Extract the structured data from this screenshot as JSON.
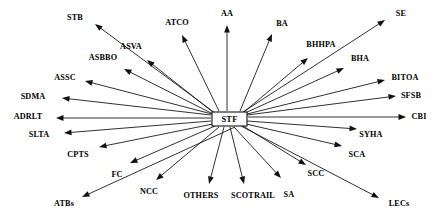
{
  "diagram": {
    "type": "radial-network",
    "canvas": {
      "width": 439,
      "height": 217
    },
    "style": {
      "background_color": "#ffffff",
      "line_color": "#1a1a1a",
      "arrow_color": "#111111",
      "text_color": "#000000",
      "node_fill": "#ffffff",
      "node_stroke": "#111111"
    },
    "center": {
      "label": "STF",
      "x": 229.5,
      "y": 119,
      "box": {
        "x": 212,
        "y": 112,
        "width": 35,
        "height": 14
      }
    },
    "edge_count": 24,
    "nodes": [
      {
        "id": "stb",
        "label": "STB",
        "label_x": 75,
        "label_y": 18,
        "tip_x": 95,
        "tip_y": 24,
        "start_x": 215,
        "start_y": 113
      },
      {
        "id": "atco",
        "label": "ATCO",
        "label_x": 177,
        "label_y": 23,
        "tip_x": 182,
        "tip_y": 35,
        "start_x": 219,
        "start_y": 111
      },
      {
        "id": "aa",
        "label": "AA",
        "label_x": 227,
        "label_y": 14,
        "tip_x": 227,
        "tip_y": 25,
        "start_x": 227,
        "start_y": 111
      },
      {
        "id": "ba",
        "label": "BA",
        "label_x": 282,
        "label_y": 24,
        "tip_x": 272,
        "tip_y": 34,
        "start_x": 240,
        "start_y": 111
      },
      {
        "id": "se",
        "label": "SE",
        "label_x": 401,
        "label_y": 14,
        "tip_x": 385,
        "tip_y": 20,
        "start_x": 243,
        "start_y": 112
      },
      {
        "id": "asva",
        "label": "ASVA",
        "label_x": 131,
        "label_y": 47,
        "tip_x": 147,
        "tip_y": 60,
        "start_x": 214,
        "start_y": 113
      },
      {
        "id": "asbbo",
        "label": "ASBBO",
        "label_x": 103,
        "label_y": 58,
        "tip_x": 124,
        "tip_y": 69,
        "start_x": 213,
        "start_y": 114
      },
      {
        "id": "bhhpa",
        "label": "BHHPA",
        "label_x": 321,
        "label_y": 45,
        "tip_x": 308,
        "tip_y": 58,
        "start_x": 244,
        "start_y": 112
      },
      {
        "id": "bha",
        "label": "BHA",
        "label_x": 360,
        "label_y": 59,
        "tip_x": 344,
        "tip_y": 68,
        "start_x": 245,
        "start_y": 113
      },
      {
        "id": "assc",
        "label": "ASSC",
        "label_x": 65,
        "label_y": 78,
        "tip_x": 85,
        "tip_y": 81,
        "start_x": 212,
        "start_y": 114
      },
      {
        "id": "bitoa",
        "label": "BITOA",
        "label_x": 405,
        "label_y": 78,
        "tip_x": 385,
        "tip_y": 80,
        "start_x": 247,
        "start_y": 114
      },
      {
        "id": "sdma",
        "label": "SDMA",
        "label_x": 33,
        "label_y": 97,
        "tip_x": 62,
        "tip_y": 98,
        "start_x": 211,
        "start_y": 115
      },
      {
        "id": "sfsb",
        "label": "SFSB",
        "label_x": 411,
        "label_y": 96,
        "tip_x": 396,
        "tip_y": 96,
        "start_x": 247,
        "start_y": 115
      },
      {
        "id": "adrlt",
        "label": "ADRLT",
        "label_x": 28,
        "label_y": 117,
        "tip_x": 56,
        "tip_y": 118,
        "start_x": 211,
        "start_y": 118
      },
      {
        "id": "cbi",
        "label": "CBI",
        "label_x": 419,
        "label_y": 117,
        "tip_x": 406,
        "tip_y": 117,
        "start_x": 248,
        "start_y": 117
      },
      {
        "id": "slta",
        "label": "SLTA",
        "label_x": 39,
        "label_y": 135,
        "tip_x": 64,
        "tip_y": 133,
        "start_x": 211,
        "start_y": 121
      },
      {
        "id": "syha",
        "label": "SYHA",
        "label_x": 371,
        "label_y": 135,
        "tip_x": 357,
        "tip_y": 129,
        "start_x": 247,
        "start_y": 121
      },
      {
        "id": "cpts",
        "label": "CPTS",
        "label_x": 78,
        "label_y": 155,
        "tip_x": 99,
        "tip_y": 147,
        "start_x": 213,
        "start_y": 124
      },
      {
        "id": "sca",
        "label": "SCA",
        "label_x": 357,
        "label_y": 155,
        "tip_x": 342,
        "tip_y": 146,
        "start_x": 246,
        "start_y": 124
      },
      {
        "id": "fc",
        "label": "FC",
        "label_x": 117,
        "label_y": 175,
        "tip_x": 130,
        "tip_y": 163,
        "start_x": 215,
        "start_y": 126
      },
      {
        "id": "scc",
        "label": "SCC",
        "label_x": 316,
        "label_y": 174,
        "tip_x": 306,
        "tip_y": 165,
        "start_x": 243,
        "start_y": 126
      },
      {
        "id": "ncc",
        "label": "NCC",
        "label_x": 149,
        "label_y": 192,
        "tip_x": 156,
        "tip_y": 180,
        "start_x": 219,
        "start_y": 127
      },
      {
        "id": "others",
        "label": "OTHERS",
        "label_x": 201,
        "label_y": 196,
        "tip_x": 209,
        "tip_y": 184,
        "start_x": 224,
        "start_y": 127
      },
      {
        "id": "scotrail",
        "label": "SCOTRAIL",
        "label_x": 253,
        "label_y": 196,
        "tip_x": 244,
        "tip_y": 184,
        "start_x": 230,
        "start_y": 127
      },
      {
        "id": "sa",
        "label": "SA",
        "label_x": 289,
        "label_y": 195,
        "tip_x": 281,
        "tip_y": 178,
        "start_x": 234,
        "start_y": 127
      },
      {
        "id": "atbs",
        "label": "ATBs",
        "label_x": 64,
        "label_y": 204,
        "tip_x": 82,
        "tip_y": 197,
        "start_x": 235,
        "start_y": 127
      },
      {
        "id": "lecs",
        "label": "LECs",
        "label_x": 399,
        "label_y": 204,
        "tip_x": 379,
        "tip_y": 198,
        "start_x": 241,
        "start_y": 126
      }
    ]
  }
}
